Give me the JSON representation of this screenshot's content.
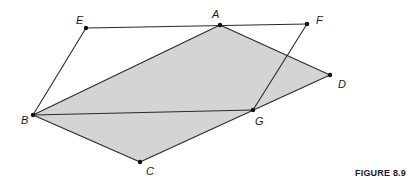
{
  "figure": {
    "caption": "FIGURE 8.9",
    "fill_color": "#d4d4d4",
    "stroke_color": "#2a2a2a",
    "points": {
      "A": {
        "label": "A",
        "x": 220,
        "y": 25,
        "lx": 212,
        "ly": 18
      },
      "B": {
        "label": "B",
        "x": 33,
        "y": 115,
        "lx": 21,
        "ly": 124
      },
      "C": {
        "label": "C",
        "x": 140,
        "y": 162,
        "lx": 146,
        "ly": 175
      },
      "D": {
        "label": "D",
        "x": 330,
        "y": 75,
        "lx": 338,
        "ly": 88
      },
      "E": {
        "label": "E",
        "x": 86,
        "y": 28,
        "lx": 76,
        "ly": 24
      },
      "F": {
        "label": "F",
        "x": 307,
        "y": 24,
        "lx": 316,
        "ly": 24
      },
      "G": {
        "label": "G",
        "x": 253,
        "y": 110,
        "lx": 255,
        "ly": 125
      }
    },
    "shaded_polygon": [
      "A",
      "D",
      "C",
      "B"
    ],
    "segments": [
      [
        "E",
        "F"
      ],
      [
        "F",
        "G"
      ],
      [
        "B",
        "E"
      ],
      [
        "B",
        "G"
      ],
      [
        "B",
        "A"
      ],
      [
        "A",
        "D"
      ],
      [
        "D",
        "C"
      ],
      [
        "C",
        "B"
      ]
    ]
  }
}
